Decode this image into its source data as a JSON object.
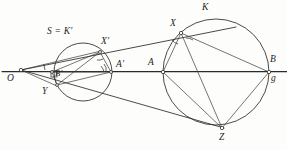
{
  "figure": {
    "kind": "geometry-diagram",
    "background_color": "#fdfdfc",
    "ink_color": "#2b2b2b"
  },
  "labels": {
    "O": "O",
    "S_eq_Kprime": "S = K′",
    "Xprime": "X′",
    "Aprime": "A′",
    "Bprime": "B′",
    "Y": "Y",
    "A": "A",
    "B": "B",
    "g": "g",
    "K": "K",
    "X": "X",
    "Z": "Z"
  },
  "points": {
    "O": {
      "x": 21,
      "y": 70
    },
    "Bprime": {
      "x": 52,
      "y": 72
    },
    "Xprime": {
      "x": 100,
      "y": 52
    },
    "Aprime": {
      "x": 111,
      "y": 72
    },
    "Y": {
      "x": 57,
      "y": 85
    },
    "A": {
      "x": 163,
      "y": 72
    },
    "B": {
      "x": 269,
      "y": 72
    },
    "X": {
      "x": 181,
      "y": 33
    },
    "Z": {
      "x": 222,
      "y": 128
    }
  },
  "circles": {
    "small": {
      "cx": 83,
      "cy": 72,
      "r": 29,
      "name": "S = K′"
    },
    "large": {
      "cx": 216,
      "cy": 72,
      "r": 53,
      "name": "K"
    }
  },
  "label_positions": {
    "O": {
      "x": 7,
      "y": 74
    },
    "S_eq_Kprime": {
      "x": 47,
      "y": 27
    },
    "Xprime": {
      "x": 101,
      "y": 37
    },
    "Aprime": {
      "x": 116,
      "y": 60
    },
    "Bprime": {
      "x": 55,
      "y": 69
    },
    "Y": {
      "x": 42,
      "y": 87
    },
    "A": {
      "x": 148,
      "y": 58
    },
    "B": {
      "x": 270,
      "y": 55
    },
    "g": {
      "x": 271,
      "y": 74
    },
    "K": {
      "x": 202,
      "y": 3
    },
    "X": {
      "x": 170,
      "y": 19
    },
    "Z": {
      "x": 219,
      "y": 133
    }
  },
  "baseline": {
    "name": "g",
    "x_start": 2,
    "x_end": 287,
    "y": 72
  }
}
